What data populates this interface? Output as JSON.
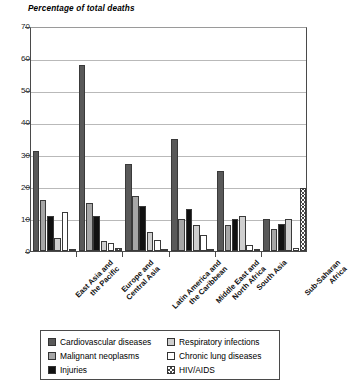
{
  "chart_data": {
    "type": "bar",
    "title": "Percentage of total deaths",
    "xlabel": "",
    "ylabel": "Percentage of total deaths",
    "ylim": [
      0,
      70
    ],
    "ytick_step": 10,
    "yticks": [
      70,
      60,
      50,
      40,
      30,
      20,
      10,
      0
    ],
    "grid": true,
    "legend_position": "bottom",
    "categories": [
      "East Asia and the Pacific",
      "Europe and Central Asia",
      "Latin America and the Caribbean",
      "Middle East and North Africa",
      "South Asia",
      "Sub-Saharan Africa"
    ],
    "category_lines": [
      [
        "East Asia and",
        "the Pacific"
      ],
      [
        "Europe and",
        "Central Asia"
      ],
      [
        "Latin America and",
        "the Caribbean"
      ],
      [
        "Middle East and",
        "North Africa"
      ],
      [
        "South Asia"
      ],
      [
        "Sub-Saharan",
        "Africa"
      ]
    ],
    "series": [
      {
        "name": "Cardiovascular diseases",
        "color": "#595959",
        "pattern": "solid",
        "values": [
          31,
          58,
          27,
          35,
          25,
          10
        ]
      },
      {
        "name": "Malignant neoplasms",
        "color": "#a6a6a6",
        "pattern": "solid",
        "values": [
          16,
          15,
          17,
          10,
          8,
          7
        ]
      },
      {
        "name": "Injuries",
        "color": "#111111",
        "pattern": "solid",
        "values": [
          11,
          11,
          14,
          13,
          10,
          8.5
        ]
      },
      {
        "name": "Respiratory infections",
        "color": "#cfcfcf",
        "pattern": "solid",
        "values": [
          4,
          3,
          6,
          8,
          11,
          10
        ]
      },
      {
        "name": "Chronic lung diseases",
        "color": "#ffffff",
        "pattern": "solid",
        "values": [
          12,
          2.5,
          3.5,
          5,
          2,
          1
        ]
      },
      {
        "name": "HIV/AIDS",
        "color": "#ffffff",
        "pattern": "hatched",
        "values": [
          0.5,
          0.8,
          0.6,
          0.3,
          0.4,
          19.5
        ]
      }
    ]
  },
  "legend": {
    "left_column": [
      {
        "label": "Cardiovascular diseases",
        "swatch": "swatch-cardiovascular"
      },
      {
        "label": "Malignant neoplasms",
        "swatch": "swatch-neoplasms"
      },
      {
        "label": "Injuries",
        "swatch": "swatch-injuries"
      }
    ],
    "right_column": [
      {
        "label": "Respiratory infections",
        "swatch": "swatch-respiratory"
      },
      {
        "label": "Chronic lung diseases",
        "swatch": "swatch-chronic-lung"
      },
      {
        "label": "HIV/AIDS",
        "swatch": "swatch-hiv-aids"
      }
    ]
  }
}
